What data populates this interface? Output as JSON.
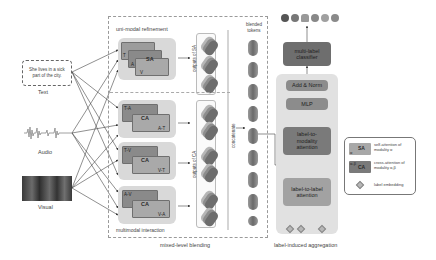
{
  "inputs": {
    "text": {
      "caption": "Text",
      "sentence": "She lives in a sick part of the city."
    },
    "audio": {
      "caption": "Audio"
    },
    "visual": {
      "caption": "Visual"
    }
  },
  "mixed_level_blending": {
    "section_label": "mixed-level blending",
    "uni_modal": {
      "title": "uni-modal refinement",
      "sa_block": {
        "main": "SA",
        "layers": [
          "T",
          "A",
          "V"
        ]
      },
      "outputs_label": "outputs of SA"
    },
    "multimodal": {
      "title": "multimodal interaction",
      "ca_blocks": [
        {
          "main": "CA",
          "top": "T-A",
          "bottom": "A-T"
        },
        {
          "main": "CA",
          "top": "T-V",
          "bottom": "V-T"
        },
        {
          "main": "CA",
          "top": "A-V",
          "bottom": "V-A"
        }
      ],
      "outputs_label": "outputs of CA"
    },
    "concatenate_label": "concatenate",
    "blended_tokens_label": "blended tokens",
    "token_count": 9
  },
  "label_induced_aggregation": {
    "section_label": "label-induced aggregation",
    "blocks": {
      "classifier": "multi-label classifier",
      "add_norm": "Add & Norm",
      "mlp": "MLP",
      "label_to_modality": "label-to-modality attention",
      "label_to_label": "label-to-label attention"
    },
    "output_emotions": [
      "emotion-1",
      "emotion-2",
      "emotion-3",
      "emotion-4",
      "emotion-5",
      "emotion-6"
    ],
    "label_embeddings_count": 3
  },
  "legend": {
    "items": [
      {
        "swatch": "SA",
        "swatch_sub": "α",
        "desc": "self-attention of modality α"
      },
      {
        "swatch": "CA",
        "swatch_sub": "α-β",
        "desc": "cross-attention of modality α,β"
      },
      {
        "swatch": "diamond",
        "desc": "label embedding"
      }
    ]
  },
  "colors": {
    "box_soft": "#d9d9d9",
    "block_dark": "#6e6e6e",
    "block_mid": "#8c8c8c",
    "block_light": "#a5a5a5",
    "line": "#333333",
    "dashed": "#9a9a9a"
  }
}
